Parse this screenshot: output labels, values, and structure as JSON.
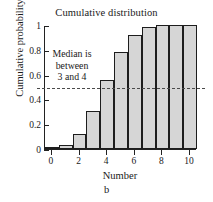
{
  "chart_data": {
    "type": "bar",
    "title": "Cumulative distribution",
    "xlabel": "Number",
    "ylabel": "Cumulative probability",
    "categories": [
      0,
      1,
      2,
      3,
      4,
      5,
      6,
      7,
      8,
      9,
      10
    ],
    "values": [
      0.005,
      0.03,
      0.12,
      0.31,
      0.555,
      0.78,
      0.92,
      0.98,
      1.0,
      1.0,
      1.0
    ],
    "xlim": [
      -0.5,
      10.5
    ],
    "ylim": [
      0,
      1
    ],
    "xticks": [
      "0",
      "2",
      "4",
      "6",
      "8",
      "10"
    ],
    "xtick_values": [
      0,
      2,
      4,
      6,
      8,
      10
    ],
    "yticks": [
      "0",
      "0.2",
      "0.4",
      "0.6",
      "0.8",
      "1"
    ],
    "ytick_values": [
      0,
      0.2,
      0.4,
      0.6,
      0.8,
      1
    ],
    "grid": false,
    "legend": null,
    "bar_fill_color": "#d6d6d6",
    "bar_edge_color": "#1d1d1d",
    "annotations": [
      {
        "name": "median-note",
        "lines": [
          "Median is",
          "between",
          "3 and 4"
        ],
        "line1": "Median is",
        "line2": "between",
        "line3": "3 and 4"
      }
    ],
    "reference_lines": [
      {
        "name": "median-level",
        "orientation": "horizontal",
        "value": 0.5,
        "style": "dashed",
        "color": "#4a4a4a"
      }
    ]
  },
  "caption": {
    "label": "b"
  }
}
